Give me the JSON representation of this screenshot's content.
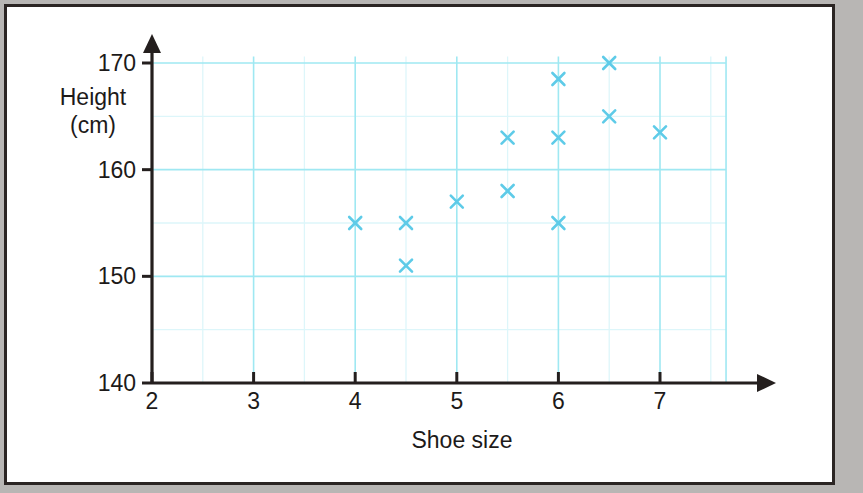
{
  "chart_data": {
    "type": "scatter",
    "title": "",
    "xlabel": "Shoe size",
    "ylabel": "Height (cm)",
    "ylabel_lines": [
      "Height",
      "(cm)"
    ],
    "xlim": [
      2,
      7.65
    ],
    "ylim": [
      140,
      170.6
    ],
    "x_ticks": [
      2,
      3,
      4,
      5,
      6,
      7
    ],
    "x_tick_labels": [
      "2",
      "3",
      "4",
      "5",
      "6",
      "7"
    ],
    "y_ticks": [
      140,
      150,
      160,
      170
    ],
    "y_tick_labels": [
      "140",
      "150",
      "160",
      "170"
    ],
    "x_major_grid_step": 1,
    "x_minor_grid_step": 0.5,
    "y_major_grid_step": 10,
    "y_minor_grid_step": 5,
    "grid": true,
    "legend": null,
    "marker": "x",
    "marker_color": "#5ecbe8",
    "grid_major_color": "#9fe8f2",
    "grid_minor_color": "#ddf6fa",
    "axis_color": "#241f1e",
    "points": [
      {
        "x": 4,
        "y": 155
      },
      {
        "x": 4.5,
        "y": 155
      },
      {
        "x": 4.5,
        "y": 151
      },
      {
        "x": 5,
        "y": 157
      },
      {
        "x": 5.5,
        "y": 163
      },
      {
        "x": 5.5,
        "y": 158
      },
      {
        "x": 6,
        "y": 168.5
      },
      {
        "x": 6,
        "y": 163
      },
      {
        "x": 6,
        "y": 155
      },
      {
        "x": 6.5,
        "y": 170
      },
      {
        "x": 6.5,
        "y": 165
      },
      {
        "x": 7,
        "y": 163.5
      }
    ]
  }
}
